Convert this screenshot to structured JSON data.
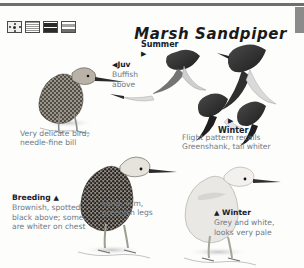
{
  "page": {
    "title": "Marsh Sandpiper",
    "top_rule": true,
    "edge_tab_color": "#8b8b8b"
  },
  "status_icons": [
    {
      "name": "range-map-icon",
      "label": "range"
    },
    {
      "name": "habitat-hatched-icon",
      "label": "habitat"
    },
    {
      "name": "abundance-dark-icon",
      "label": "abundance"
    },
    {
      "name": "abundance-light-icon",
      "label": "scarcity"
    }
  ],
  "annotations": {
    "juv": {
      "arrow": "◀",
      "heading": "Juv",
      "body": "Buffish above"
    },
    "summer": {
      "heading": "Summer",
      "arrow": "▶"
    },
    "winter_flight": {
      "heading": "Winter",
      "arrow": "▶"
    },
    "delicate": {
      "body": "Very delicate bird; needle-fine bill"
    },
    "flight": {
      "body": "Flight pattern recalls Greenshank, tail whiter"
    },
    "breeding": {
      "heading": "Breeding",
      "arrow": "▲",
      "body": "Brownish, spotted black above; some are whiter on chest"
    },
    "legs": {
      "body": "Long, slim, greenish legs"
    },
    "winter": {
      "arrow": "▲",
      "heading": "Winter",
      "body": "Grey and white, looks very pale"
    }
  },
  "figures": [
    {
      "name": "juvenile-standing-bird",
      "plumage": "Juvenile"
    },
    {
      "name": "summer-flight-bird",
      "plumage": "Summer"
    },
    {
      "name": "winter-flight-bird-a",
      "plumage": "Winter"
    },
    {
      "name": "winter-flight-bird-b",
      "plumage": "Winter"
    },
    {
      "name": "breeding-standing-bird",
      "plumage": "Breeding"
    },
    {
      "name": "winter-standing-bird",
      "plumage": "Winter"
    }
  ],
  "colors": {
    "text_body": "#6d7a86",
    "text_heading": "#15202b",
    "rule": "#6e6e6e",
    "plumage_dark": "#3a3a3a",
    "plumage_light": "#cfcfcf"
  }
}
